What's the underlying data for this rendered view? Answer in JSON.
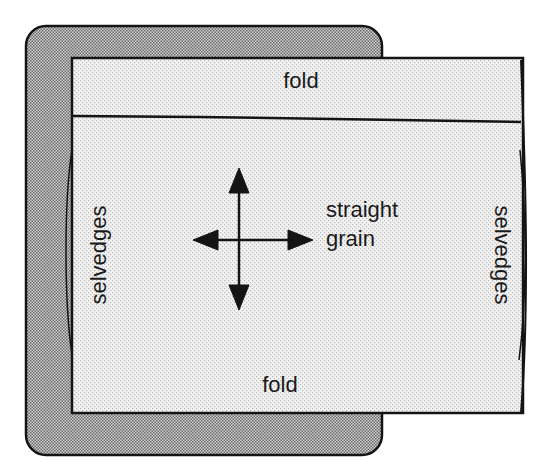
{
  "diagram": {
    "labels": {
      "fold_top": "fold",
      "fold_bottom": "fold",
      "grain_line1": "straight",
      "grain_line2": "grain",
      "selvedges_left": "selvedges",
      "selvedges_right": "selvedges"
    },
    "colors": {
      "outer_fill": "#a9a9a9",
      "fabric_fill": "#e6e6e6",
      "stroke": "#141414",
      "text": "#1a1a1a"
    }
  }
}
